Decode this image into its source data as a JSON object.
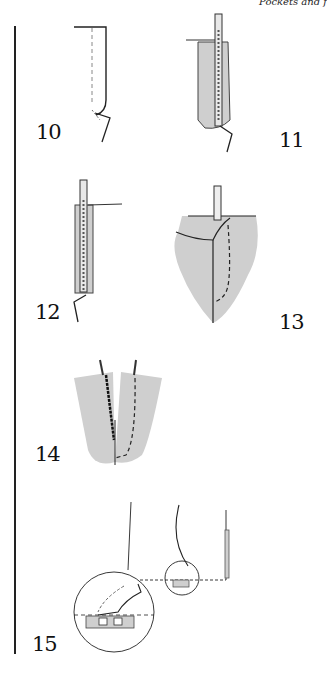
{
  "page": {
    "header_text": "Pockets and f",
    "colors": {
      "fabric_fill": "#cfcfcf",
      "line": "#222222",
      "background": "#ffffff"
    }
  },
  "steps": [
    {
      "number": "10",
      "figure": "fly-edge-outline-with-dashed-stitch-line"
    },
    {
      "number": "11",
      "figure": "zipper-on-shaded-fabric-strip"
    },
    {
      "number": "12",
      "figure": "zipper-stitched-to-facing"
    },
    {
      "number": "13",
      "figure": "shaded-fabric-with-zipper-and-dashed-curve-stitch"
    },
    {
      "number": "14",
      "figure": "two-shaded-panels-v-shape-with-zipper-tapes"
    },
    {
      "number": "15",
      "figure": "garment-outline-with-magnified-circle-detail"
    }
  ]
}
